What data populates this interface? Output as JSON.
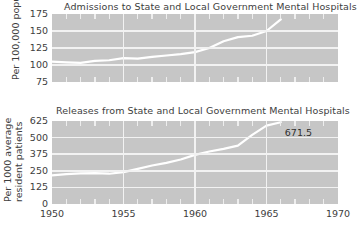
{
  "figure": {
    "background_color": "#ffffff",
    "plot_background_color": "#c6c6c6",
    "gridline_color": "#f2f2f2",
    "series_color": "#ffffff"
  },
  "charts": {
    "top": {
      "title": "Admissions to State and Local Government Mental Hospitals",
      "ylabel": "Per 100,000 population",
      "yticks": [
        "175",
        "150",
        "125",
        "100",
        "75"
      ]
    },
    "bottom": {
      "title": "Releases from State and Local Government Mental Hospitals",
      "ylabel_line1": "Per 1000 average",
      "ylabel_line2": "resident patients",
      "yticks": [
        "625",
        "500",
        "375",
        "250",
        "125",
        "0"
      ],
      "annotation": "671.5"
    },
    "xticks": [
      "1950",
      "1955",
      "1960",
      "1965",
      "1970"
    ]
  },
  "chart_data": [
    {
      "type": "line",
      "title": "Admissions to State and Local Government Mental Hospitals",
      "xlabel": "",
      "ylabel": "Per 100,000 population",
      "xlim": [
        1950,
        1970
      ],
      "ylim": [
        75,
        175
      ],
      "yticks": [
        75,
        100,
        125,
        150,
        175
      ],
      "xticks": [
        1950,
        1955,
        1960,
        1965,
        1970
      ],
      "grid": true,
      "legend": "none",
      "x": [
        1950,
        1951,
        1952,
        1953,
        1954,
        1955,
        1956,
        1957,
        1958,
        1959,
        1960,
        1961,
        1962,
        1963,
        1964,
        1965,
        1966
      ],
      "values": [
        105,
        104,
        103,
        106,
        107,
        110,
        109.5,
        112,
        114,
        116,
        119,
        125,
        135,
        141,
        143,
        150,
        167
      ]
    },
    {
      "type": "line",
      "title": "Releases from State and Local Government Mental Hospitals",
      "xlabel": "",
      "ylabel": "Per 1000 average resident patients",
      "xlim": [
        1950,
        1970
      ],
      "ylim": [
        0,
        625
      ],
      "yticks": [
        0,
        125,
        250,
        375,
        500,
        625
      ],
      "xticks": [
        1950,
        1955,
        1960,
        1965,
        1970
      ],
      "grid": true,
      "legend": "none",
      "annotations": [
        {
          "x": 1966,
          "y": 671.5,
          "text": "671.5"
        }
      ],
      "x": [
        1950,
        1951,
        1952,
        1953,
        1954,
        1955,
        1956,
        1957,
        1958,
        1959,
        1960,
        1961,
        1962,
        1963,
        1964,
        1965,
        1966
      ],
      "values": [
        215,
        225,
        230,
        232,
        228,
        240,
        265,
        290,
        310,
        335,
        370,
        395,
        415,
        440,
        520,
        590,
        671.5
      ]
    }
  ]
}
